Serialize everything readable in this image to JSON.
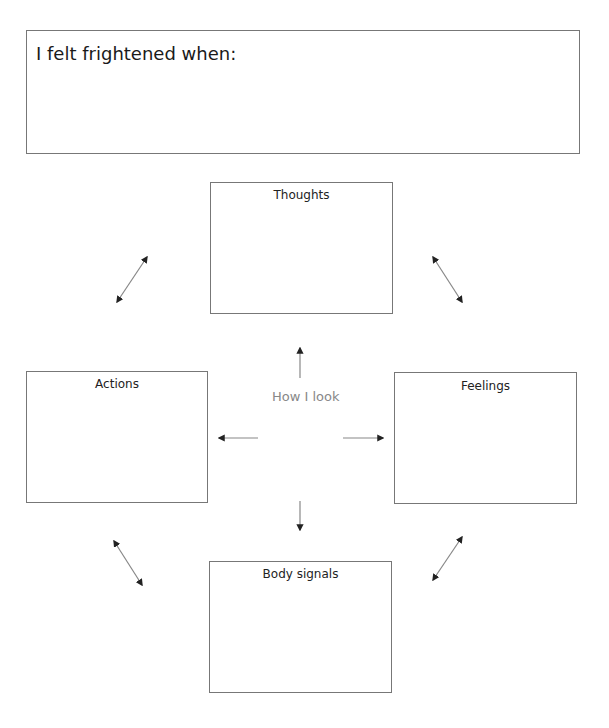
{
  "prompt_box": {
    "label": "I felt frightened when:"
  },
  "center": {
    "label": "How I look"
  },
  "boxes": {
    "thoughts": {
      "title": "Thoughts"
    },
    "actions": {
      "title": "Actions"
    },
    "feelings": {
      "title": "Feelings"
    },
    "body_signals": {
      "title": "Body signals"
    }
  },
  "colors": {
    "border": "#777777",
    "arrow": "#222222",
    "center_text": "#888888"
  }
}
